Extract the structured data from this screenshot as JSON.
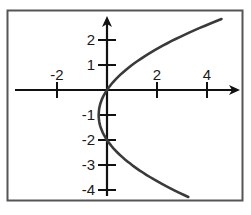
{
  "chart_data": {
    "type": "line",
    "title": "",
    "xlabel": "",
    "ylabel": "",
    "equation": "x = y(y+2)/3",
    "xlim": [
      -4,
      5.4
    ],
    "ylim": [
      -4.4,
      3.2
    ],
    "grid": false,
    "legend": null,
    "x_ticks": [
      -2,
      2,
      4
    ],
    "x_tick_labels": [
      "-2",
      "2",
      "4"
    ],
    "y_ticks": [
      2,
      1,
      -1,
      -2,
      -3,
      -4
    ],
    "y_tick_labels": [
      "2",
      "1",
      "-1",
      "-2",
      "-3",
      "-4"
    ],
    "series": [
      {
        "name": "parabola",
        "color": "#3a3a3a",
        "points": [
          {
            "x": 3.36,
            "y": -4.28
          },
          {
            "x": 2.33,
            "y": -3.65
          },
          {
            "x": 1.0,
            "y": -3.0
          },
          {
            "x": 0.0,
            "y": -2.0
          },
          {
            "x": -0.33,
            "y": -1.0
          },
          {
            "x": 0.0,
            "y": 0.0
          },
          {
            "x": 1.0,
            "y": 1.0
          },
          {
            "x": 2.67,
            "y": 2.0
          },
          {
            "x": 4.68,
            "y": 2.84
          }
        ]
      }
    ]
  },
  "colors": {
    "axis": "#111111",
    "curve": "#3a3a3a",
    "frame": "#555555"
  }
}
